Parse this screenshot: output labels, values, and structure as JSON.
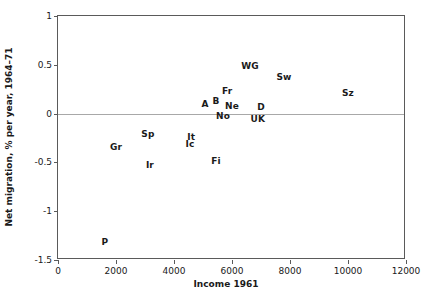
{
  "chart_data": {
    "type": "scatter",
    "title": "",
    "xlabel": "Income 1961",
    "ylabel": "Net migration, % per year, 1964–71",
    "xlim": [
      0,
      12000
    ],
    "ylim": [
      -1.5,
      1
    ],
    "xticks": [
      0,
      2000,
      4000,
      6000,
      8000,
      10000,
      12000
    ],
    "xticklabels": [
      "0",
      "2000",
      "4000",
      "6000",
      "8000",
      "10000",
      "12000"
    ],
    "yticks": [
      1,
      0.5,
      0,
      -0.5,
      -1,
      -1.5
    ],
    "yticklabels": [
      "1",
      "0.5",
      "0",
      "-0.5",
      "-1",
      "-1.5"
    ],
    "grid": false,
    "legend": null,
    "marker_style": "text-label",
    "reference_lines": [
      {
        "axis": "y",
        "value": 0,
        "color": "#a8a8a8"
      }
    ],
    "points": [
      {
        "label": "P",
        "x": 1620,
        "y": -1.32
      },
      {
        "label": "Gr",
        "x": 2000,
        "y": -0.34
      },
      {
        "label": "Sp",
        "x": 3100,
        "y": -0.21
      },
      {
        "label": "Ir",
        "x": 3170,
        "y": -0.53
      },
      {
        "label": "It",
        "x": 4590,
        "y": -0.24
      },
      {
        "label": "Ic",
        "x": 4550,
        "y": -0.31
      },
      {
        "label": "Fi",
        "x": 5450,
        "y": -0.49
      },
      {
        "label": "A",
        "x": 5070,
        "y": 0.1
      },
      {
        "label": "B",
        "x": 5450,
        "y": 0.13
      },
      {
        "label": "Fr",
        "x": 5830,
        "y": 0.23
      },
      {
        "label": "Ne",
        "x": 6000,
        "y": 0.08
      },
      {
        "label": "No",
        "x": 5690,
        "y": -0.02
      },
      {
        "label": "WG",
        "x": 6620,
        "y": 0.49
      },
      {
        "label": "D",
        "x": 7000,
        "y": 0.07
      },
      {
        "label": "UK",
        "x": 6890,
        "y": -0.06
      },
      {
        "label": "Sw",
        "x": 7790,
        "y": 0.38
      },
      {
        "label": "Sz",
        "x": 10000,
        "y": 0.21
      }
    ]
  }
}
